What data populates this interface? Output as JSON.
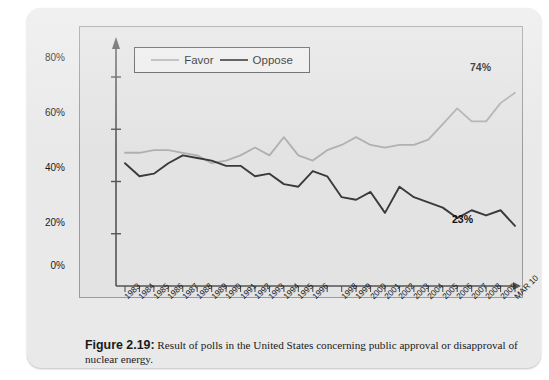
{
  "credit": {
    "text": "Based on NEI. http://lh6.ggpht.com/markjr2/SLW9KfPMCwi/AAAAAAAAADYk_ocIDGEGEM/ pops_chart%5B4%5D.jpg"
  },
  "legend": {
    "favor_label": "Favor",
    "oppose_label": "Oppose"
  },
  "annotations": {
    "favor_end": "74%",
    "oppose_end": "23%"
  },
  "caption": {
    "figure_number": "Figure 2.19:",
    "text": " Result of polls in the United States concerning public approval or disapproval of nuclear energy."
  },
  "colors": {
    "favor_line": "#b0b0b0",
    "oppose_line": "#3a3a3a",
    "plot_background": "#e3e3e3",
    "card_background": "#e9e9e9",
    "axis": "#555555"
  },
  "chart_data": {
    "type": "line",
    "title": "",
    "xlabel": "",
    "ylabel": "",
    "ylim": [
      0,
      90
    ],
    "yticks": [
      0,
      20,
      40,
      60,
      80
    ],
    "ytick_labels": [
      "0%",
      "20%",
      "40%",
      "60%",
      "80%"
    ],
    "grid": false,
    "legend_position": "top-left-inside",
    "categories": [
      "1983",
      "1984",
      "1985",
      "1986",
      "1987",
      "1988",
      "1989",
      "1990",
      "1991",
      "1992",
      "1993",
      "1994",
      "1995",
      "1996",
      "",
      "1998",
      "1999",
      "2000",
      "2001",
      "2002",
      "2003",
      "2004",
      "2005",
      "2006",
      "2007",
      "2008",
      "2009",
      "MAR 10"
    ],
    "xtick_labels": [
      "1983",
      "1984",
      "1985",
      "1986",
      "1987",
      "1988",
      "1989",
      "1990",
      "1991",
      "1992",
      "1993",
      "1994",
      "1995",
      "1996",
      "1998",
      "1999",
      "2000",
      "2001",
      "2002",
      "2003",
      "2004",
      "2005",
      "2006",
      "2007",
      "2008",
      "2009",
      "MAR 10"
    ],
    "series": [
      {
        "name": "Favor",
        "color": "#b0b0b0",
        "values": [
          51,
          51,
          52,
          52,
          51,
          50,
          47,
          48,
          50,
          53,
          50,
          57,
          50,
          48,
          52,
          54,
          57,
          54,
          53,
          54,
          54,
          56,
          62,
          68,
          63,
          63,
          70,
          74
        ]
      },
      {
        "name": "Oppose",
        "color": "#3a3a3a",
        "values": [
          47,
          42,
          43,
          47,
          50,
          49,
          48,
          46,
          46,
          42,
          43,
          39,
          38,
          44,
          42,
          34,
          33,
          36,
          28,
          38,
          34,
          32,
          30,
          26,
          29,
          27,
          29,
          23
        ]
      }
    ]
  }
}
